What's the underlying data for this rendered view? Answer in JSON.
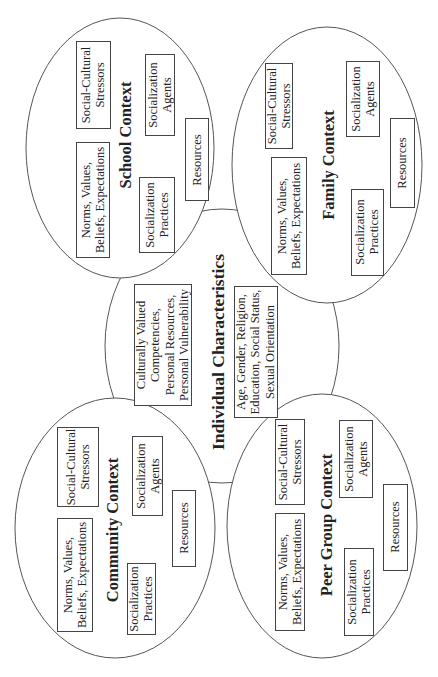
{
  "diagram": {
    "orientation": "rotated -90 degrees",
    "center": {
      "title": "Individual Characteristics",
      "boxes": [
        {
          "lines": [
            "Culturally Valued",
            "Competencies,",
            "Personal Resources,",
            "Personal Vulnerability"
          ]
        },
        {
          "lines": [
            "Age, Gender,  Religion,",
            "Education, Social Status,",
            "Sexual Orientation"
          ]
        }
      ]
    },
    "contexts": [
      {
        "id": "school",
        "title": "School Context",
        "boxes": {
          "norms": [
            "Norms, Values,",
            "Beliefs, Expectations"
          ],
          "stressors": [
            "Social-Cultural",
            "Stressors"
          ],
          "practices": [
            "Socialization",
            "Practices"
          ],
          "agents": [
            "Socialization",
            "Agents"
          ],
          "resources": [
            "Resources"
          ]
        }
      },
      {
        "id": "family",
        "title": "Family Context",
        "boxes": {
          "norms": [
            "Norms, Values,",
            "Beliefs, Expectations"
          ],
          "stressors": [
            "Social-Cultural",
            "Stressors"
          ],
          "practices": [
            "Socialization",
            "Practices"
          ],
          "agents": [
            "Socialization",
            "Agents"
          ],
          "resources": [
            "Resources"
          ]
        }
      },
      {
        "id": "community",
        "title": "Community Context",
        "boxes": {
          "norms": [
            "Norms, Values,",
            "Beliefs, Expectations"
          ],
          "stressors": [
            "Social-Cultural",
            "Stressors"
          ],
          "practices": [
            "Socialization",
            "Practices"
          ],
          "agents": [
            "Socialization",
            "Agents"
          ],
          "resources": [
            "Resources"
          ]
        }
      },
      {
        "id": "peer",
        "title": "Peer Group Context",
        "boxes": {
          "norms": [
            "Norms, Values,",
            "Beliefs, Expectations"
          ],
          "stressors": [
            "Social-Cultural",
            "Stressors"
          ],
          "practices": [
            "Socialization",
            "Practices"
          ],
          "agents": [
            "Socialization",
            "Agents"
          ],
          "resources": [
            "Resources"
          ]
        }
      }
    ]
  }
}
